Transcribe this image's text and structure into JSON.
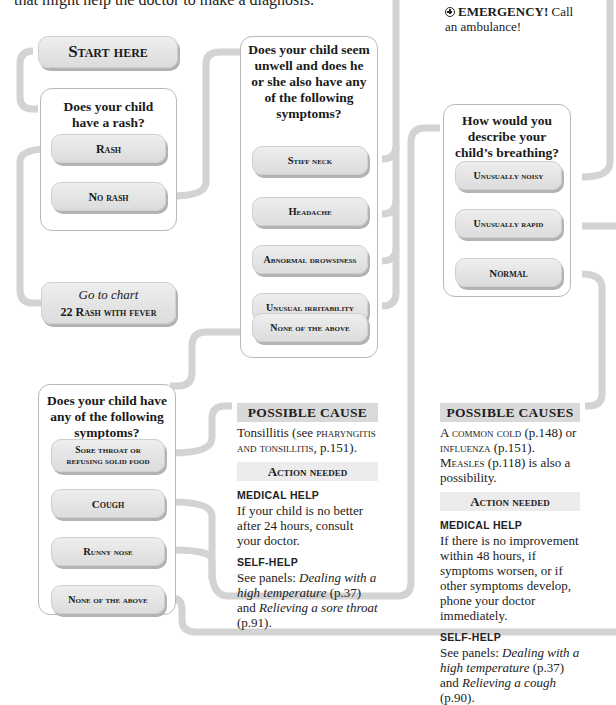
{
  "intro": {
    "text": "that might help the doctor to make a diagnosis."
  },
  "emergency": {
    "label": "EMERGENCY!",
    "text": " Call an ambulance!"
  },
  "start": {
    "label": "Start here"
  },
  "q_rash": {
    "question": "Does your child have a rash?",
    "options": [
      {
        "label": "Rash"
      },
      {
        "label": "No rash"
      }
    ]
  },
  "goto_chart": {
    "prefix": "Go to chart",
    "chart": "22 Rash with fever"
  },
  "q_unwell": {
    "question": "Does your child seem unwell and does he or she also have any of the following symptoms?",
    "options": [
      {
        "label": "Stiff neck"
      },
      {
        "label": "Headache"
      },
      {
        "label": "Abnormal drowsiness"
      },
      {
        "label": "Unusual irritability"
      },
      {
        "label": "None of the above"
      }
    ]
  },
  "q_breathing": {
    "question": "How would you describe your child’s breathing?",
    "options": [
      {
        "label": "Unusually noisy"
      },
      {
        "label": "Unusually rapid"
      },
      {
        "label": "Normal"
      }
    ]
  },
  "q_symptoms": {
    "question": "Does your child have any of the following symptoms?",
    "options": [
      {
        "label": "Sore throat or refusing solid food"
      },
      {
        "label": "Cough"
      },
      {
        "label": "Runny nose"
      },
      {
        "label": "None of the above"
      }
    ]
  },
  "result_tonsillitis": {
    "heading": "POSSIBLE CAUSE",
    "cause_pre": "Tonsillitis (see ",
    "cause_link": "pharyngitis and tonsillitis",
    "cause_post": ", p.151).",
    "action_heading": "Action needed",
    "medical_label": "MEDICAL HELP",
    "medical_text": "If your child is no better after 24 hours, consult your doctor.",
    "self_label": "SELF-HELP",
    "self_pre": "See panels: ",
    "self_link1": "Dealing with a high temperature",
    "self_mid": " (p.37) and ",
    "self_link2": "Relieving a sore throat",
    "self_post": " (p.91)."
  },
  "result_cold": {
    "heading": "POSSIBLE CAUSES",
    "cause_a": "A ",
    "cause_link1": "common cold",
    "cause_b": " (p.148) or ",
    "cause_link2": "influenza",
    "cause_c": " (p.151). ",
    "cause_link3": "Measles",
    "cause_d": " (p.118) is also a possibility.",
    "action_heading": "Action needed",
    "medical_label": "MEDICAL HELP",
    "medical_text": "If there is no improvement within 48 hours, if symptoms worsen, or if other symptoms develop, phone your doctor immediately.",
    "self_label": "SELF-HELP",
    "self_pre": "See panels: ",
    "self_link1": "Dealing with a high temperature",
    "self_mid": " (p.37) and ",
    "self_link2": "Relieving a cough",
    "self_post": " (p.90)."
  },
  "colors": {
    "connector": "#d2d2d2",
    "box_border": "#b9b9b9",
    "button_fill": "#e4e4e4",
    "heading_fill": "#d9d9d9"
  }
}
